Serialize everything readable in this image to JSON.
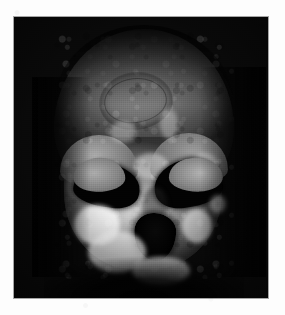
{
  "page": {
    "kind": "photographic-plate",
    "background_color": "#fdfdfd",
    "width_px": 285,
    "height_px": 315
  },
  "plate": {
    "name": "fossil-cranium-photograph",
    "description": "Black-and-white photograph of a fossil hominin cranium in anterior (frontal) view against a black background",
    "background_color": "#0b0b0b",
    "left_px": 14,
    "top_px": 17,
    "width_px": 254,
    "height_px": 281,
    "caption": ""
  },
  "specimen": {
    "view": "anterior",
    "subject": "hominin cranium",
    "tone_range": "grayscale",
    "features": [
      {
        "name": "cranial-vault",
        "label": "Cranial vault"
      },
      {
        "name": "frontal-lesion",
        "label": "Oval depression on frontal bone"
      },
      {
        "name": "orbit-left",
        "label": "Left orbit"
      },
      {
        "name": "orbit-right",
        "label": "Right orbit"
      },
      {
        "name": "nasal-aperture",
        "label": "Nasal aperture"
      },
      {
        "name": "maxilla",
        "label": "Maxilla / alveolar region"
      },
      {
        "name": "zygomatic-right",
        "label": "Right zygomatic process"
      }
    ]
  },
  "colors": {
    "plate_black": "#0b0b0b",
    "bone_light": "#f3f3ee",
    "bone_mid": "#8d8d8a",
    "bone_dark": "#3a3a38",
    "socket_black": "#090909",
    "paper_white": "#fdfdfd"
  }
}
